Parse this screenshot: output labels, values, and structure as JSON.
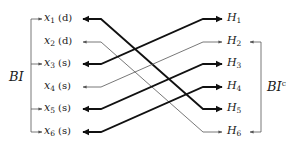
{
  "diagram": {
    "left_group_label": "BI",
    "right_group_label": "BI",
    "right_group_superscript": "c",
    "left_nodes": [
      {
        "id": "x1",
        "var": "x",
        "sub": "1",
        "tag": "(d)",
        "y": 19
      },
      {
        "id": "x2",
        "var": "x",
        "sub": "2",
        "tag": "(d)",
        "y": 42
      },
      {
        "id": "x3",
        "var": "x",
        "sub": "3",
        "tag": "(s)",
        "y": 64
      },
      {
        "id": "x4",
        "var": "x",
        "sub": "4",
        "tag": "(s)",
        "y": 87
      },
      {
        "id": "x5",
        "var": "x",
        "sub": "5",
        "tag": "(s)",
        "y": 109
      },
      {
        "id": "x6",
        "var": "x",
        "sub": "6",
        "tag": "(s)",
        "y": 132
      }
    ],
    "right_nodes": [
      {
        "id": "H1",
        "var": "H",
        "sub": "1",
        "y": 19
      },
      {
        "id": "H2",
        "var": "H",
        "sub": "2",
        "y": 42
      },
      {
        "id": "H3",
        "var": "H",
        "sub": "3",
        "y": 64
      },
      {
        "id": "H4",
        "var": "H",
        "sub": "4",
        "y": 87
      },
      {
        "id": "H5",
        "var": "H",
        "sub": "5",
        "y": 109
      },
      {
        "id": "H6",
        "var": "H",
        "sub": "6",
        "y": 132
      }
    ],
    "edges": [
      {
        "from": "x1",
        "to": "H5",
        "weight": "thick"
      },
      {
        "from": "x2",
        "to": "H6",
        "weight": "thin"
      },
      {
        "from": "x3",
        "to": "H1",
        "weight": "thick"
      },
      {
        "from": "x4",
        "to": "H2",
        "weight": "thin"
      },
      {
        "from": "x5",
        "to": "H3",
        "weight": "thick"
      },
      {
        "from": "x6",
        "to": "H4",
        "weight": "thick"
      }
    ],
    "left_bracket_targets": [
      "x1",
      "x3",
      "x5",
      "x6"
    ],
    "right_bracket_targets": [
      "H2",
      "H6"
    ],
    "colors": {
      "thick": "#111111",
      "thin": "#555555",
      "bracket": "#555555"
    }
  }
}
